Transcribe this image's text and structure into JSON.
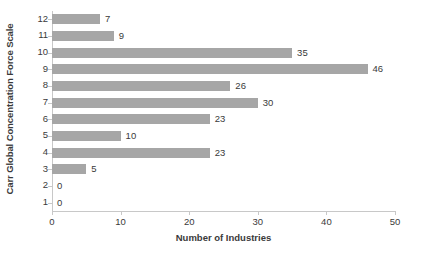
{
  "chart_data": {
    "type": "bar",
    "orientation": "horizontal",
    "title": "",
    "xlabel": "Number of Industries",
    "ylabel": "Carr Global Concentration Force Scale",
    "categories": [
      "1",
      "2",
      "3",
      "4",
      "5",
      "6",
      "7",
      "8",
      "9",
      "10",
      "11",
      "12"
    ],
    "values": [
      0,
      0,
      5,
      23,
      10,
      23,
      30,
      26,
      46,
      35,
      9,
      7
    ],
    "data_labels": [
      "0",
      "0",
      "5",
      "23",
      "10",
      "23",
      "30",
      "26",
      "46",
      "35",
      "9",
      "7"
    ],
    "xlim": [
      0,
      50
    ],
    "xticks": [
      0,
      10,
      20,
      30,
      40,
      50
    ],
    "xtick_labels": [
      "0",
      "10",
      "20",
      "30",
      "40",
      "50"
    ],
    "grid": false,
    "legend": null,
    "bar_color": "#a6a6a6",
    "axis_color": "#c8c8c8",
    "text_color": "#3a3a3a",
    "background": "#ffffff"
  }
}
